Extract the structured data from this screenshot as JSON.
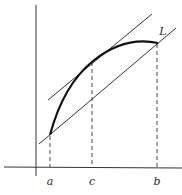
{
  "diagram": {
    "labels": {
      "a": "a",
      "c": "c",
      "b": "b",
      "curve": "L"
    },
    "colors": {
      "background": "#ffffff",
      "ink": "#2a2a2a",
      "curve": "#111111"
    },
    "elements": [
      {
        "id": "y-axis",
        "type": "axis"
      },
      {
        "id": "x-axis",
        "type": "axis"
      },
      {
        "id": "curve-L",
        "type": "curve",
        "from": "a",
        "to": "b"
      },
      {
        "id": "secant-line",
        "type": "line",
        "through": [
          "A",
          "B"
        ]
      },
      {
        "id": "tangent-line",
        "type": "line",
        "touches": "C",
        "parallel_to": "secant-line"
      },
      {
        "id": "dashed-a",
        "type": "dashed-vertical",
        "at": "a"
      },
      {
        "id": "dashed-c",
        "type": "dashed-vertical",
        "at": "c"
      },
      {
        "id": "dashed-b",
        "type": "dashed-vertical",
        "at": "b"
      }
    ]
  }
}
